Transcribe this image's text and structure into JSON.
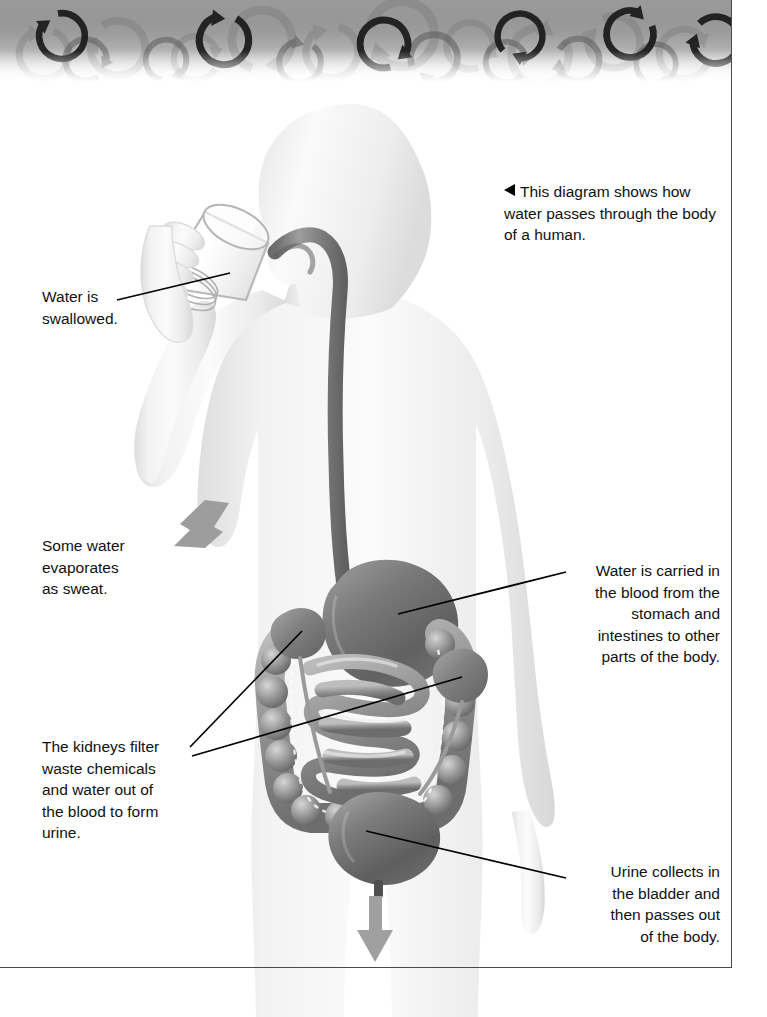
{
  "page": {
    "title": "How water passes through the body of a human",
    "background": "#ffffff",
    "border_color": "#4a4a4a"
  },
  "header": {
    "name": "decorative-cycle-band",
    "motif": "circular-arrow",
    "motif_count": 18,
    "gradient_from": "#9a9a9a",
    "gradient_to": "#ffffff"
  },
  "caption": {
    "arrow_glyph": "◀",
    "text": "This diagram shows how water passes through the body of a human."
  },
  "labels": [
    {
      "id": "swallowed",
      "name": "label-water-swallowed",
      "text": "Water is\nswallowed.",
      "align": "left"
    },
    {
      "id": "sweat",
      "name": "label-some-water-evaporates",
      "text": "Some water\nevaporates\nas sweat.",
      "align": "left"
    },
    {
      "id": "kidneys",
      "name": "label-kidneys-filter",
      "text": "The kidneys filter\nwaste chemicals\nand water out of\nthe blood to form\nurine.",
      "align": "left"
    },
    {
      "id": "blood",
      "name": "label-water-carried-in-blood",
      "text": "Water is carried in\nthe blood from the\nstomach and\nintestines to other\nparts of the body.",
      "align": "right"
    },
    {
      "id": "urine",
      "name": "label-urine-collects",
      "text": "Urine collects in\nthe bladder and\nthen passes out\nof the body.",
      "align": "right"
    }
  ],
  "illustration": {
    "body_fill_light": "#f4f4f4",
    "body_fill_shadow": "#e2e2e2",
    "organ_dark": "#6e6e6e",
    "organ_mid": "#8d8d8d",
    "organ_light": "#c9c9c9",
    "arrow_gray": "#9b9b9b",
    "glass_outline": "#bdbdbd",
    "parts": [
      {
        "name": "human-body-silhouette",
        "role": "outline of a standing person seen from the front, head turned in profile"
      },
      {
        "name": "drinking-glass",
        "role": "tilted glass held by the left hand at the mouth"
      },
      {
        "name": "hand-holding-glass",
        "role": "fingers wrapped around the glass"
      },
      {
        "name": "esophagus",
        "role": "tube curving from the mouth down to the stomach"
      },
      {
        "name": "stomach",
        "role": "large dark organ below the esophagus"
      },
      {
        "name": "small-intestine",
        "role": "coiled tube in the centre of the abdomen"
      },
      {
        "name": "large-intestine",
        "role": "ring of pouches around the small intestine"
      },
      {
        "name": "kidney-left",
        "role": "bean-shaped organ at the upper left of the abdomen"
      },
      {
        "name": "kidney-right",
        "role": "bean-shaped organ at the upper right of the abdomen"
      },
      {
        "name": "ureters",
        "role": "thin tubes from kidneys to bladder"
      },
      {
        "name": "bladder",
        "role": "dark rounded organ at the base of the abdomen"
      },
      {
        "name": "urethra-outflow-arrow",
        "role": "gray arrow pointing down out of the body"
      },
      {
        "name": "sweat-arrow",
        "role": "gray arrow pointing down-left away from the torso"
      }
    ]
  }
}
